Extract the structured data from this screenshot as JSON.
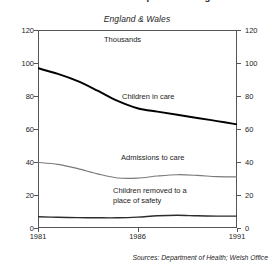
{
  "title": "Children in care and on protection registers",
  "subtitle": "England & Wales",
  "units_label": "Thousands",
  "source_note": "Sources:  Department of Health; Welsh Office",
  "axes": {
    "y_left_ticks": [
      "120",
      "100",
      "80",
      "60",
      "40",
      "20",
      "0"
    ],
    "y_right_ticks": [
      "120",
      "100",
      "80",
      "60",
      "40",
      "20",
      "0"
    ],
    "x_ticks": [
      "1981",
      "1986",
      "1991"
    ],
    "ylim": [
      0,
      120
    ],
    "xlim": [
      1981,
      1991
    ]
  },
  "series_labels": {
    "s0": "Children in care",
    "s1": "Admissions to care",
    "s2_line1": "Children removed to a",
    "s2_line2": "place of safety"
  },
  "colors": {
    "frame": "#555555",
    "children_in_care": "#000000",
    "admissions_to_care": "#7a7a7a",
    "place_of_safety": "#2b2b2b",
    "text": "#1d1d1d",
    "background": "#ffffff"
  },
  "chart_data": {
    "type": "line",
    "title": "Children in care and on protection registers",
    "subtitle": "England & Wales",
    "xlabel": "",
    "ylabel": "Thousands",
    "xlim": [
      1981,
      1991
    ],
    "ylim": [
      0,
      120
    ],
    "grid": false,
    "legend": "inline-annotations",
    "x": [
      1981,
      1982,
      1983,
      1984,
      1985,
      1986,
      1987,
      1988,
      1989,
      1990,
      1991
    ],
    "series": [
      {
        "name": "Children in care",
        "color": "#000000",
        "values": [
          96.8,
          93.4,
          89.0,
          83.2,
          77.0,
          72.6,
          70.5,
          68.6,
          66.7,
          64.8,
          62.8
        ]
      },
      {
        "name": "Admissions to care",
        "color": "#7a7a7a",
        "values": [
          39.7,
          38.6,
          36.0,
          32.8,
          30.3,
          30.2,
          31.5,
          32.3,
          31.9,
          31.1,
          31.0
        ]
      },
      {
        "name": "Children removed to a place of safety",
        "color": "#2b2b2b",
        "values": [
          6.8,
          6.5,
          6.3,
          6.2,
          6.2,
          6.6,
          7.4,
          7.7,
          7.4,
          7.2,
          7.2
        ]
      }
    ]
  }
}
